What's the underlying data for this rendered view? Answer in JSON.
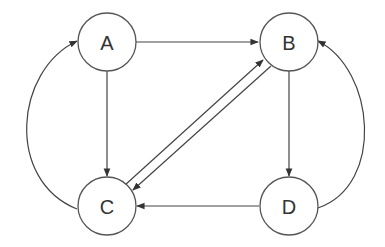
{
  "diagram": {
    "type": "directed-graph",
    "nodes": [
      {
        "id": "A",
        "label": "A"
      },
      {
        "id": "B",
        "label": "B"
      },
      {
        "id": "C",
        "label": "C"
      },
      {
        "id": "D",
        "label": "D"
      }
    ],
    "edges": [
      {
        "from": "A",
        "to": "B"
      },
      {
        "from": "A",
        "to": "C"
      },
      {
        "from": "C",
        "to": "A",
        "style": "curved"
      },
      {
        "from": "C",
        "to": "B"
      },
      {
        "from": "B",
        "to": "C"
      },
      {
        "from": "B",
        "to": "D"
      },
      {
        "from": "D",
        "to": "C"
      },
      {
        "from": "D",
        "to": "B",
        "style": "curved"
      }
    ],
    "colors": {
      "stroke": "#444444",
      "text": "#333333",
      "background": "#ffffff"
    }
  }
}
